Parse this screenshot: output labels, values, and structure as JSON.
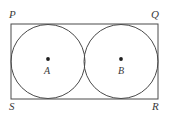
{
  "figure": {
    "background_color": "#ffffff",
    "stroke_color": "#4a4a4a",
    "label_color": "#3a3a3a",
    "rectangle": {
      "name": "PQRS",
      "x": 11,
      "y": 24,
      "width": 147,
      "height": 75,
      "stroke_width": 1
    },
    "vertices": [
      {
        "id": "P",
        "label": "P",
        "x": 11,
        "y": 24,
        "position": "top-left"
      },
      {
        "id": "Q",
        "label": "Q",
        "x": 158,
        "y": 24,
        "position": "top-right"
      },
      {
        "id": "R",
        "label": "R",
        "x": 158,
        "y": 99,
        "position": "bottom-right"
      },
      {
        "id": "S",
        "label": "S",
        "x": 11,
        "y": 99,
        "position": "bottom-left"
      }
    ],
    "circles": [
      {
        "id": "A",
        "label": "A",
        "cx": 48,
        "cy": 61.5,
        "r": 37,
        "stroke_width": 1
      },
      {
        "id": "B",
        "label": "B",
        "cx": 121,
        "cy": 61.5,
        "r": 37,
        "stroke_width": 1
      }
    ],
    "center_dots": [
      {
        "id": "dot-A",
        "cx": 48,
        "cy": 59,
        "r": 1.9
      },
      {
        "id": "dot-B",
        "cx": 121,
        "cy": 59,
        "r": 1.9
      }
    ]
  }
}
